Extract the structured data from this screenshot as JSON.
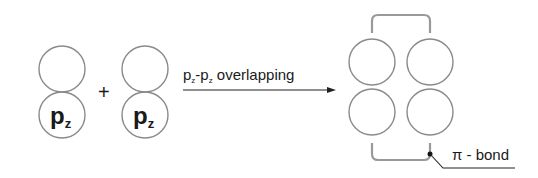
{
  "diagram": {
    "orbital_left": {
      "label": "p",
      "subscript": "z"
    },
    "plus": "+",
    "orbital_right": {
      "label": "p",
      "subscript": "z"
    },
    "arrow_label": {
      "p1": "p",
      "s1": "z",
      "dash": "-",
      "p2": "p",
      "s2": "z",
      "text": " overlapping"
    },
    "bond_label": "π - bond",
    "colors": {
      "orbital_stroke": "#8a8a8a",
      "bracket_stroke": "#999999",
      "text": "#1a1a1a"
    }
  }
}
